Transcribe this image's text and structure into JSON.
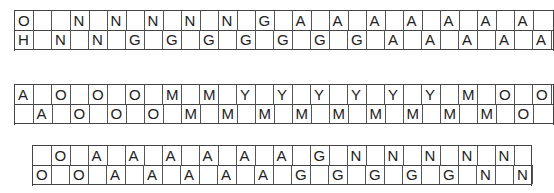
{
  "puzzle": {
    "cell_width": 18.5,
    "blocks": [
      {
        "name": "block-1",
        "left": 14,
        "top": 10,
        "width": 540,
        "cols": 29,
        "rows": [
          {
            "cells": [
              {
                "col": 0,
                "letter": "O"
              },
              {
                "col": 2,
                "letter": ""
              },
              {
                "col": 3,
                "letter": "N"
              },
              {
                "col": 5,
                "letter": "N"
              },
              {
                "col": 7,
                "letter": "N"
              },
              {
                "col": 9,
                "letter": "N"
              },
              {
                "col": 11,
                "letter": "N"
              },
              {
                "col": 13,
                "letter": "G"
              },
              {
                "col": 15,
                "letter": "A"
              },
              {
                "col": 17,
                "letter": "A"
              },
              {
                "col": 19,
                "letter": "A"
              },
              {
                "col": 21,
                "letter": "A"
              },
              {
                "col": 23,
                "letter": "A"
              },
              {
                "col": 25,
                "letter": "A"
              },
              {
                "col": 27,
                "letter": "A"
              }
            ]
          },
          {
            "cells": [
              {
                "col": 0,
                "letter": "H"
              },
              {
                "col": 2,
                "letter": "N"
              },
              {
                "col": 4,
                "letter": "N"
              },
              {
                "col": 6,
                "letter": "G"
              },
              {
                "col": 8,
                "letter": "G"
              },
              {
                "col": 10,
                "letter": "G"
              },
              {
                "col": 12,
                "letter": "G"
              },
              {
                "col": 14,
                "letter": "G"
              },
              {
                "col": 16,
                "letter": "G"
              },
              {
                "col": 18,
                "letter": "G"
              },
              {
                "col": 20,
                "letter": "A"
              },
              {
                "col": 22,
                "letter": "A"
              },
              {
                "col": 24,
                "letter": "A"
              },
              {
                "col": 26,
                "letter": "A"
              },
              {
                "col": 28,
                "letter": "A"
              }
            ]
          }
        ]
      },
      {
        "name": "block-2",
        "left": 14,
        "top": 84,
        "width": 540,
        "cols": 29,
        "rows": [
          {
            "cells": [
              {
                "col": 0,
                "letter": "A"
              },
              {
                "col": 2,
                "letter": "O"
              },
              {
                "col": 4,
                "letter": "O"
              },
              {
                "col": 6,
                "letter": "O"
              },
              {
                "col": 8,
                "letter": "M"
              },
              {
                "col": 10,
                "letter": "M"
              },
              {
                "col": 12,
                "letter": "Y"
              },
              {
                "col": 14,
                "letter": "Y"
              },
              {
                "col": 16,
                "letter": "Y"
              },
              {
                "col": 18,
                "letter": "Y"
              },
              {
                "col": 20,
                "letter": "Y"
              },
              {
                "col": 22,
                "letter": "Y"
              },
              {
                "col": 24,
                "letter": "M"
              },
              {
                "col": 26,
                "letter": "O"
              },
              {
                "col": 28,
                "letter": "O"
              }
            ]
          },
          {
            "cells": [
              {
                "col": 1,
                "letter": "A"
              },
              {
                "col": 3,
                "letter": "O"
              },
              {
                "col": 5,
                "letter": "O"
              },
              {
                "col": 7,
                "letter": "O"
              },
              {
                "col": 9,
                "letter": "M"
              },
              {
                "col": 11,
                "letter": "M"
              },
              {
                "col": 13,
                "letter": "M"
              },
              {
                "col": 15,
                "letter": "M"
              },
              {
                "col": 17,
                "letter": "M"
              },
              {
                "col": 19,
                "letter": "M"
              },
              {
                "col": 21,
                "letter": "M"
              },
              {
                "col": 23,
                "letter": "M"
              },
              {
                "col": 25,
                "letter": "M"
              },
              {
                "col": 27,
                "letter": "O"
              }
            ]
          }
        ]
      },
      {
        "name": "block-3",
        "left": 32,
        "top": 145,
        "width": 500,
        "cols": 27,
        "rows": [
          {
            "cells": [
              {
                "col": 1,
                "letter": "O"
              },
              {
                "col": 3,
                "letter": "A"
              },
              {
                "col": 5,
                "letter": "A"
              },
              {
                "col": 7,
                "letter": "A"
              },
              {
                "col": 9,
                "letter": "A"
              },
              {
                "col": 11,
                "letter": "A"
              },
              {
                "col": 13,
                "letter": "A"
              },
              {
                "col": 15,
                "letter": "G"
              },
              {
                "col": 17,
                "letter": "N"
              },
              {
                "col": 19,
                "letter": "N"
              },
              {
                "col": 21,
                "letter": "N"
              },
              {
                "col": 23,
                "letter": "N"
              },
              {
                "col": 25,
                "letter": "N"
              }
            ]
          },
          {
            "cells": [
              {
                "col": 0,
                "letter": "O"
              },
              {
                "col": 2,
                "letter": "O"
              },
              {
                "col": 4,
                "letter": "A"
              },
              {
                "col": 6,
                "letter": "A"
              },
              {
                "col": 8,
                "letter": "A"
              },
              {
                "col": 10,
                "letter": "A"
              },
              {
                "col": 12,
                "letter": "A"
              },
              {
                "col": 14,
                "letter": "G"
              },
              {
                "col": 16,
                "letter": "G"
              },
              {
                "col": 18,
                "letter": "G"
              },
              {
                "col": 20,
                "letter": "G"
              },
              {
                "col": 22,
                "letter": "G"
              },
              {
                "col": 24,
                "letter": "N"
              },
              {
                "col": 26,
                "letter": "N"
              }
            ]
          }
        ]
      }
    ]
  }
}
